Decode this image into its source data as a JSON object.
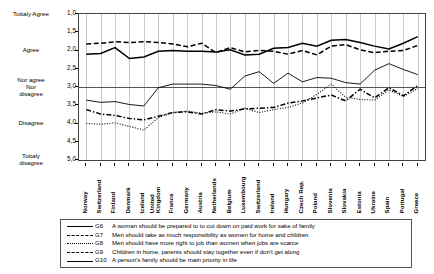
{
  "chart_data": {
    "type": "line",
    "title": "",
    "xlabel": "",
    "ylabel": "",
    "ylim": [
      1.0,
      5.0
    ],
    "y_inverted": true,
    "grid": "vertical",
    "legend_position": "bottom",
    "y_ticks": [
      "1,0",
      "1,5",
      "2,0",
      "2,5",
      "3,0",
      "3,5",
      "4,0",
      "4,5",
      "5,0"
    ],
    "y_tick_values": [
      1.0,
      1.5,
      2.0,
      2.5,
      3.0,
      3.5,
      4.0,
      4.5,
      5.0
    ],
    "y_categories": [
      {
        "label": "Tottaly Agree",
        "value": 1.0
      },
      {
        "label": "Agree",
        "value": 2.0
      },
      {
        "label": "Nor agree Nor disagree",
        "value": 3.0
      },
      {
        "label": "Disagree",
        "value": 4.0
      },
      {
        "label": "Tottaly disagree",
        "value": 5.0
      }
    ],
    "reference_line": 3.0,
    "categories": [
      "Norway",
      "Switzerland",
      "Finland",
      "Denmark",
      "Iceland",
      "United Kingdom",
      "France",
      "Germany",
      "Austria",
      "Netherlands",
      "Belgium",
      "Luxembourg",
      "Switzerland",
      "Ireland",
      "Hungary",
      "Czech Rep.",
      "Poland",
      "Slovenia",
      "Slovakia",
      "Estonia",
      "Ukraine",
      "Spain",
      "Portugal",
      "Greece"
    ],
    "series": [
      {
        "name": "G6",
        "style": "solid",
        "label": "A woman should be prepared to to cut down on paid work for sake of family",
        "values": [
          2.1,
          2.08,
          1.92,
          2.22,
          2.18,
          2.02,
          2.0,
          2.02,
          2.02,
          2.04,
          1.98,
          2.12,
          2.1,
          1.94,
          1.92,
          1.8,
          1.88,
          1.72,
          1.7,
          1.78,
          1.88,
          1.96,
          1.8,
          1.62
        ]
      },
      {
        "name": "G7",
        "style": "dashed",
        "label": "Men should take as much responsibility as women for home and children",
        "values": [
          1.82,
          1.8,
          1.76,
          1.78,
          1.76,
          1.78,
          1.82,
          1.9,
          1.8,
          2.06,
          1.92,
          2.04,
          2.0,
          2.02,
          2.1,
          2.0,
          2.12,
          1.88,
          1.84,
          1.98,
          2.06,
          2.02,
          2.0,
          1.86
        ]
      },
      {
        "name": "G8",
        "style": "dotted",
        "label": "Men should have more right to job than women when jobs are scarce",
        "values": [
          4.0,
          4.02,
          3.98,
          4.08,
          4.18,
          3.84,
          3.7,
          3.66,
          3.72,
          3.68,
          3.74,
          3.58,
          3.7,
          3.62,
          3.56,
          3.44,
          3.2,
          2.92,
          3.28,
          3.34,
          3.36,
          3.08,
          3.26,
          3.04
        ]
      },
      {
        "name": "G9",
        "style": "dashdot",
        "label": "Children in home, parents should stay together even if don't get along",
        "values": [
          3.62,
          3.74,
          3.78,
          3.86,
          3.9,
          3.8,
          3.7,
          3.68,
          3.74,
          3.62,
          3.66,
          3.6,
          3.58,
          3.56,
          3.44,
          3.38,
          3.3,
          3.22,
          3.38,
          3.06,
          3.3,
          3.02,
          3.24,
          2.96
        ]
      },
      {
        "name": "G10",
        "style": "solid-thin",
        "label": "A person's family should be main priority in life",
        "values": [
          3.36,
          3.42,
          3.4,
          3.48,
          3.52,
          3.02,
          2.92,
          2.92,
          2.92,
          2.96,
          3.06,
          2.7,
          2.58,
          2.9,
          2.62,
          2.86,
          2.74,
          2.76,
          2.88,
          2.92,
          2.54,
          2.36,
          2.52,
          2.66
        ]
      }
    ]
  },
  "legend": {
    "rows": [
      {
        "code": "G6",
        "text": "A woman should be prepared to to cut down on paid work for sake of family"
      },
      {
        "code": "G7",
        "text": "Men should take as much responsibility as women for home and children"
      },
      {
        "code": "G8",
        "text": "Men should have more right to job than women when jobs are scarce"
      },
      {
        "code": "G9",
        "text": "Children in home, parents should stay together even if don't get along"
      },
      {
        "code": "G10",
        "text": "A person's family should be main priority in life"
      }
    ]
  }
}
